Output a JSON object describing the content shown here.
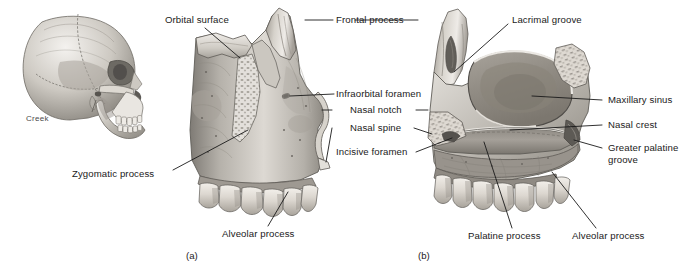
{
  "figure": {
    "signature": "Creek",
    "captions": [
      {
        "id": "panel-a",
        "text": "(a)"
      },
      {
        "id": "panel-b",
        "text": "(b)"
      }
    ]
  },
  "panel_a": {
    "view": "lateral view of right maxilla",
    "labels": [
      {
        "id": "orbital-surface",
        "text": "Orbital surface"
      },
      {
        "id": "frontal-process",
        "text": "Frontal process"
      },
      {
        "id": "infraorbital-foramen",
        "text": "Infraorbital foramen"
      },
      {
        "id": "nasal-notch",
        "text": "Nasal notch"
      },
      {
        "id": "nasal-spine",
        "text": "Nasal spine"
      },
      {
        "id": "zygomatic-process",
        "text": "Zygomatic process"
      },
      {
        "id": "alveolar-process-a",
        "text": "Alveolar process"
      }
    ]
  },
  "panel_b": {
    "view": "medial view of right maxilla",
    "labels": [
      {
        "id": "lacrimal-groove",
        "text": "Lacrimal groove"
      },
      {
        "id": "maxillary-sinus",
        "text": "Maxillary sinus"
      },
      {
        "id": "nasal-crest",
        "text": "Nasal crest"
      },
      {
        "id": "greater-palatine-groove",
        "text": "Greater palatine groove"
      },
      {
        "id": "incisive-foramen",
        "text": "Incisive foramen"
      },
      {
        "id": "palatine-process",
        "text": "Palatine process"
      },
      {
        "id": "alveolar-process-b",
        "text": "Alveolar process"
      }
    ]
  },
  "skull_inset": {
    "id": "skull-lateral-inset",
    "description": "lateral view of whole skull"
  },
  "colors": {
    "background": "#ffffff",
    "leader_line": "#1a1a1a",
    "text": "#1a1a1a",
    "bone_light": "#e8e6e2",
    "bone_mid": "#b9b5ae",
    "bone_dark": "#8a8680",
    "bone_shadow": "#6b6862",
    "tooth": "#ded9d2",
    "sinus_dark": "#9a948c"
  }
}
